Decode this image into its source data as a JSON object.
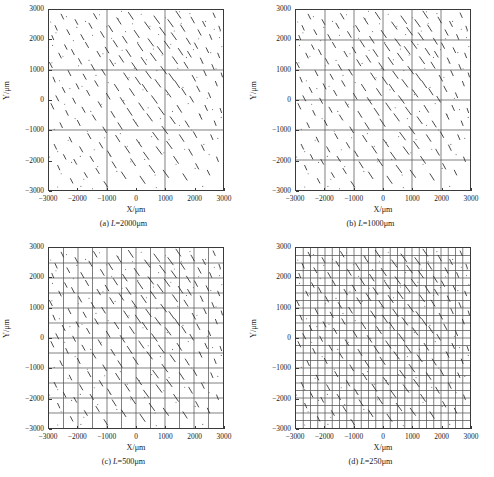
{
  "figure": {
    "axis_x_label": "X/μm",
    "axis_y_label": "Y/μm",
    "tick_values": [
      "-3000",
      "-2000",
      "-1000",
      "0",
      "1000",
      "2000",
      "3000"
    ],
    "frame_color": "#3a3a3a",
    "grid_color": "#555555",
    "segment_color": "#2b2b2b",
    "background_color": "#ffffff"
  },
  "panels": [
    {
      "key": "a",
      "caption_index": "(a)",
      "caption_var": "L",
      "caption_eq": "=2000μm",
      "caption": "(a) L=2000μm",
      "L": 2000,
      "divisions": 3
    },
    {
      "key": "b",
      "caption_index": "(b)",
      "caption_var": "L",
      "caption_eq": "=1000μm",
      "caption": "(b) L=1000μm",
      "L": 1000,
      "divisions": 6
    },
    {
      "key": "c",
      "caption_index": "(c)",
      "caption_var": "L",
      "caption_eq": "=500μm",
      "caption": "(c) L=500μm",
      "L": 500,
      "divisions": 12
    },
    {
      "key": "d",
      "caption_index": "(d)",
      "caption_var": "L",
      "caption_eq": "=250μm",
      "caption": "(d) L=250μm",
      "L": 250,
      "divisions": 24
    }
  ],
  "chart_data": {
    "type": "scatter",
    "title": "",
    "xlabel": "X/μm",
    "ylabel": "Y/μm",
    "xlim": [
      -3000,
      3000
    ],
    "ylim": [
      -3000,
      3000
    ],
    "xticks": [
      -3000,
      -2000,
      -1000,
      0,
      1000,
      2000,
      3000
    ],
    "yticks": [
      -3000,
      -2000,
      -1000,
      0,
      1000,
      2000,
      3000
    ],
    "grid": true,
    "legend": "none",
    "series_note": "Identical fracture/crack trace network rendered in all four panels; only the superimposed square mesh size L differs.",
    "grid_spacings_um": [
      2000,
      1000,
      500,
      250
    ],
    "segments": [
      [
        -2980,
        1250,
        -2890,
        1080
      ],
      [
        -2930,
        -120,
        -2840,
        -300
      ],
      [
        -2900,
        2150,
        -2840,
        2010
      ],
      [
        -2860,
        760,
        -2790,
        600
      ],
      [
        -2820,
        -1480,
        -2740,
        -1640
      ],
      [
        -2790,
        2480,
        -2720,
        2330
      ],
      [
        -2760,
        140,
        -2670,
        -30
      ],
      [
        -2700,
        -2180,
        -2630,
        -2330
      ],
      [
        -2660,
        1560,
        -2580,
        1400
      ],
      [
        -2620,
        -760,
        -2540,
        -920
      ],
      [
        -2580,
        2860,
        -2500,
        2700
      ],
      [
        -2540,
        420,
        -2450,
        250
      ],
      [
        -2500,
        -1820,
        -2420,
        -1970
      ],
      [
        -2460,
        1840,
        -2380,
        1690
      ],
      [
        -2420,
        -350,
        -2340,
        -510
      ],
      [
        -2380,
        2340,
        -2290,
        2180
      ],
      [
        -2340,
        980,
        -2250,
        810
      ],
      [
        -2300,
        -1240,
        -2220,
        -1400
      ],
      [
        -2260,
        -2620,
        -2180,
        -2770
      ],
      [
        -2220,
        1680,
        -2130,
        1510
      ],
      [
        -2180,
        60,
        -2090,
        -110
      ],
      [
        -2140,
        -1980,
        -2050,
        -2140
      ],
      [
        -2100,
        2680,
        -2010,
        2520
      ],
      [
        -2060,
        540,
        -1970,
        370
      ],
      [
        -2020,
        -680,
        -1930,
        -850
      ],
      [
        -1980,
        1380,
        -1880,
        1200
      ],
      [
        -1940,
        -1560,
        -1840,
        -1730
      ],
      [
        -1900,
        2180,
        -1800,
        2010
      ],
      [
        -1860,
        -240,
        -1760,
        -410
      ],
      [
        -1820,
        860,
        -1720,
        690
      ],
      [
        -1780,
        -2420,
        -1680,
        -2580
      ],
      [
        -1740,
        1920,
        -1640,
        1750
      ],
      [
        -1700,
        320,
        -1600,
        150
      ],
      [
        -1660,
        -1120,
        -1560,
        -1290
      ],
      [
        -1620,
        2560,
        -1520,
        2390
      ],
      [
        -1580,
        -1880,
        -1470,
        -2050
      ],
      [
        -1540,
        1180,
        -1430,
        1000
      ],
      [
        -1500,
        -500,
        -1390,
        -670
      ],
      [
        -1460,
        2880,
        -1350,
        2700
      ],
      [
        -1420,
        640,
        -1310,
        460
      ],
      [
        -1380,
        -2280,
        -1270,
        -2450
      ],
      [
        -1340,
        1620,
        -1230,
        1440
      ],
      [
        -1300,
        -60,
        -1190,
        -240
      ],
      [
        -1260,
        -1420,
        -1150,
        -1600
      ],
      [
        -1220,
        2280,
        -1100,
        2090
      ],
      [
        -1180,
        1020,
        -1060,
        830
      ],
      [
        -1140,
        -900,
        -1020,
        -1090
      ],
      [
        -1100,
        -2720,
        -980,
        -2900
      ],
      [
        -1060,
        1760,
        -940,
        1570
      ],
      [
        -1020,
        220,
        -900,
        30
      ],
      [
        -980,
        -1700,
        -860,
        -1890
      ],
      [
        -940,
        2480,
        -810,
        2280
      ],
      [
        -900,
        1340,
        -770,
        1140
      ],
      [
        -860,
        -380,
        -730,
        -580
      ],
      [
        -820,
        -2060,
        -690,
        -2260
      ],
      [
        -780,
        1980,
        -640,
        1770
      ],
      [
        -740,
        520,
        -600,
        310
      ],
      [
        -700,
        -1180,
        -560,
        -1390
      ],
      [
        -660,
        2740,
        -520,
        2530
      ],
      [
        -620,
        -760,
        -480,
        -970
      ],
      [
        -580,
        1480,
        -430,
        1260
      ],
      [
        -540,
        80,
        -390,
        -140
      ],
      [
        -500,
        -2400,
        -350,
        -2620
      ],
      [
        -460,
        2120,
        -310,
        1900
      ],
      [
        -420,
        900,
        -260,
        670
      ],
      [
        -380,
        -1540,
        -220,
        -1770
      ],
      [
        -340,
        1680,
        -180,
        1450
      ],
      [
        -300,
        -280,
        -140,
        -510
      ],
      [
        -260,
        2920,
        -100,
        2690
      ],
      [
        -220,
        380,
        -60,
        150
      ],
      [
        -180,
        -1960,
        -20,
        -2190
      ],
      [
        -140,
        1240,
        30,
        1000
      ],
      [
        -100,
        -640,
        70,
        -880
      ],
      [
        -60,
        2320,
        110,
        2080
      ],
      [
        -20,
        760,
        150,
        520
      ],
      [
        20,
        -1320,
        190,
        -1560
      ],
      [
        60,
        1880,
        230,
        1640
      ],
      [
        100,
        -100,
        270,
        -340
      ],
      [
        140,
        -2540,
        310,
        -2780
      ],
      [
        180,
        1420,
        350,
        1180
      ],
      [
        220,
        520,
        390,
        280
      ],
      [
        260,
        -1740,
        440,
        -1980
      ],
      [
        300,
        2600,
        480,
        2360
      ],
      [
        340,
        960,
        520,
        720
      ],
      [
        380,
        -460,
        560,
        -700
      ],
      [
        420,
        2040,
        600,
        1800
      ],
      [
        460,
        -2180,
        640,
        -2420
      ],
      [
        500,
        1560,
        690,
        1310
      ],
      [
        540,
        140,
        730,
        -110
      ],
      [
        580,
        -1080,
        770,
        -1330
      ],
      [
        620,
        2800,
        810,
        2550
      ],
      [
        660,
        680,
        850,
        430
      ],
      [
        700,
        -1560,
        890,
        -1810
      ],
      [
        740,
        1780,
        930,
        1530
      ],
      [
        780,
        -240,
        970,
        -490
      ],
      [
        820,
        2420,
        1010,
        2170
      ],
      [
        860,
        1120,
        1050,
        870
      ],
      [
        900,
        -880,
        1090,
        -1130
      ],
      [
        940,
        -2340,
        1120,
        -2580
      ],
      [
        980,
        1960,
        1160,
        1720
      ],
      [
        1020,
        340,
        1200,
        100
      ],
      [
        1060,
        -1380,
        1240,
        -1620
      ],
      [
        1100,
        2680,
        1280,
        2440
      ],
      [
        1140,
        880,
        1310,
        650
      ],
      [
        1180,
        -560,
        1350,
        -790
      ],
      [
        1220,
        2240,
        1390,
        2010
      ],
      [
        1260,
        1440,
        1430,
        1210
      ],
      [
        1300,
        -1880,
        1460,
        -2110
      ],
      [
        1340,
        640,
        1500,
        410
      ],
      [
        1380,
        2960,
        1540,
        2730
      ],
      [
        1420,
        -180,
        1570,
        -410
      ],
      [
        1460,
        1720,
        1610,
        1500
      ],
      [
        1500,
        -1160,
        1650,
        -1380
      ],
      [
        1540,
        2500,
        1680,
        2290
      ],
      [
        1580,
        380,
        1720,
        170
      ],
      [
        1620,
        -2460,
        1760,
        -2670
      ],
      [
        1660,
        1260,
        1790,
        1060
      ],
      [
        1700,
        -700,
        1830,
        -900
      ],
      [
        1740,
        2060,
        1870,
        1860
      ],
      [
        1780,
        1620,
        1900,
        1430
      ],
      [
        1820,
        -1640,
        1940,
        -1840
      ],
      [
        1860,
        120,
        1980,
        -70
      ],
      [
        1900,
        2760,
        2010,
        2570
      ],
      [
        1940,
        820,
        2050,
        630
      ],
      [
        1980,
        -1060,
        2090,
        -1250
      ],
      [
        2020,
        1900,
        2120,
        1720
      ],
      [
        2060,
        -2120,
        2160,
        -2300
      ],
      [
        2100,
        460,
        2200,
        280
      ],
      [
        2140,
        2340,
        2240,
        2160
      ],
      [
        2180,
        -460,
        2270,
        -640
      ],
      [
        2220,
        1400,
        2310,
        1220
      ],
      [
        2260,
        -1500,
        2350,
        -1680
      ],
      [
        2300,
        2620,
        2390,
        2450
      ],
      [
        2340,
        980,
        2420,
        810
      ],
      [
        2380,
        -180,
        2460,
        -350
      ],
      [
        2420,
        1740,
        2500,
        1580
      ],
      [
        2460,
        -2340,
        2540,
        -2500
      ],
      [
        2500,
        240,
        2570,
        80
      ],
      [
        2540,
        2180,
        2610,
        2020
      ],
      [
        2580,
        -1160,
        2650,
        -1320
      ],
      [
        2620,
        1180,
        2690,
        1020
      ],
      [
        2660,
        2900,
        2730,
        2750
      ],
      [
        2700,
        -700,
        2760,
        -850
      ],
      [
        2740,
        620,
        2800,
        470
      ],
      [
        2780,
        -1900,
        2840,
        -2050
      ],
      [
        2820,
        1560,
        2880,
        1410
      ],
      [
        2860,
        2460,
        2910,
        2320
      ],
      [
        2900,
        -280,
        2950,
        -420
      ],
      [
        2940,
        900,
        2980,
        770
      ]
    ],
    "dots": [
      [
        -2940,
        2600
      ],
      [
        -2880,
        1820
      ],
      [
        -2820,
        -980
      ],
      [
        -2760,
        2240
      ],
      [
        -2700,
        -1720
      ],
      [
        -2640,
        640
      ],
      [
        -2580,
        -2460
      ],
      [
        -2520,
        1460
      ],
      [
        -2460,
        -140
      ],
      [
        -2400,
        2780
      ],
      [
        -2340,
        -1340
      ],
      [
        -2280,
        380
      ],
      [
        -2220,
        -2080
      ],
      [
        -2160,
        1980
      ],
      [
        -2100,
        -620
      ],
      [
        -2040,
        2420
      ],
      [
        -1980,
        1140
      ],
      [
        -1920,
        -1880
      ],
      [
        -1860,
        460
      ],
      [
        -1800,
        -2640
      ],
      [
        -1740,
        2620
      ],
      [
        -1680,
        -1040
      ],
      [
        -1620,
        1320
      ],
      [
        -1560,
        -380
      ],
      [
        -1500,
        2160
      ],
      [
        -1440,
        -1660
      ],
      [
        -1380,
        820
      ],
      [
        -1320,
        -2220
      ],
      [
        -1260,
        2840
      ],
      [
        -1200,
        -140
      ],
      [
        -1140,
        1540
      ],
      [
        -1080,
        -1260
      ],
      [
        -1020,
        2440
      ],
      [
        -960,
        580
      ],
      [
        -900,
        -1840
      ],
      [
        -840,
        2060
      ],
      [
        -780,
        -520
      ],
      [
        -720,
        1220
      ],
      [
        -660,
        -2380
      ],
      [
        -600,
        2700
      ],
      [
        -540,
        -1120
      ],
      [
        -480,
        1660
      ],
      [
        -420,
        -20
      ],
      [
        -360,
        2280
      ],
      [
        -300,
        -1540
      ],
      [
        -240,
        740
      ],
      [
        -180,
        -2060
      ],
      [
        -120,
        2540
      ],
      [
        -60,
        1060
      ],
      [
        0,
        -760
      ],
      [
        60,
        1920
      ],
      [
        120,
        -1420
      ],
      [
        180,
        2860
      ],
      [
        240,
        340
      ],
      [
        300,
        -1980
      ],
      [
        360,
        1340
      ],
      [
        420,
        -260
      ],
      [
        480,
        2460
      ],
      [
        540,
        -1220
      ],
      [
        600,
        1700
      ],
      [
        660,
        -2500
      ],
      [
        720,
        980
      ],
      [
        780,
        2180
      ],
      [
        840,
        -620
      ],
      [
        900,
        1500
      ],
      [
        960,
        -1760
      ],
      [
        1020,
        2740
      ],
      [
        1080,
        180
      ],
      [
        1140,
        -1320
      ],
      [
        1200,
        1860
      ],
      [
        1260,
        -380
      ],
      [
        1320,
        2300
      ],
      [
        1380,
        -2140
      ],
      [
        1440,
        1060
      ],
      [
        1500,
        -840
      ],
      [
        1560,
        2560
      ],
      [
        1620,
        420
      ],
      [
        1680,
        -1640
      ],
      [
        1740,
        1420
      ],
      [
        1800,
        -120
      ],
      [
        1860,
        2880
      ],
      [
        1920,
        -1000
      ],
      [
        1980,
        1680
      ],
      [
        2040,
        -2280
      ],
      [
        2100,
        760
      ],
      [
        2160,
        2040
      ],
      [
        2220,
        -500
      ],
      [
        2280,
        1240
      ],
      [
        2340,
        -1480
      ],
      [
        2400,
        2620
      ],
      [
        2460,
        60
      ],
      [
        2520,
        -1820
      ],
      [
        2580,
        1580
      ],
      [
        2640,
        -320
      ],
      [
        2700,
        2360
      ],
      [
        2760,
        1040
      ],
      [
        2820,
        -1280
      ],
      [
        2880,
        2080
      ],
      [
        2940,
        -580
      ],
      [
        2960,
        1780
      ],
      [
        -2980,
        -1900
      ],
      [
        -2900,
        1240
      ],
      [
        -2700,
        -2900
      ],
      [
        -1900,
        -2880
      ],
      [
        -500,
        2960
      ],
      [
        700,
        -2920
      ],
      [
        1500,
        2940
      ],
      [
        2300,
        -2880
      ],
      [
        2900,
        2300
      ],
      [
        -1500,
        -2960
      ]
    ]
  }
}
